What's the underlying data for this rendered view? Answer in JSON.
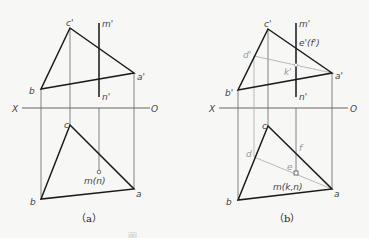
{
  "figure": {
    "panels": [
      {
        "id": "a",
        "caption": "（a）",
        "labels": {
          "c_prime": "c'",
          "m_prime": "m'",
          "a_prime": "a'",
          "b_upper": "b",
          "n_prime": "n'",
          "x_axis": "X",
          "o_axis": "O",
          "c": "c",
          "m_n": "m(n)",
          "b": "b",
          "a": "a"
        }
      },
      {
        "id": "b",
        "caption": "（b）",
        "labels": {
          "c_prime": "c'",
          "m_prime": "m'",
          "e_f_prime": "e'(f')",
          "d_prime": "d'",
          "k_prime": "k'",
          "a_prime": "a'",
          "b_prime": "b'",
          "n_prime": "n'",
          "x_axis": "X",
          "o_axis": "O",
          "c": "c",
          "d": "d",
          "f": "f",
          "e": "e",
          "m_k_n": "m(k,n)",
          "b": "b",
          "a": "a"
        }
      }
    ],
    "footer_caption": "图"
  },
  "colors": {
    "thick_line": "#1a1a1a",
    "thin_line": "#555555",
    "aux_line": "#aaaaaa",
    "label": "#444444",
    "aux_label": "#999999"
  }
}
